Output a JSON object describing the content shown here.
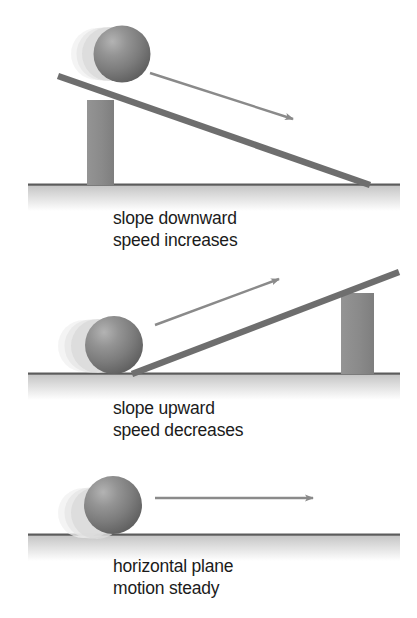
{
  "figure": {
    "background_color": "#ffffff",
    "width": 417,
    "height": 618,
    "colors": {
      "ball": "#7d7d7d",
      "ball_highlight": "#a8a8a8",
      "ball_shadow": "#5a5a5a",
      "ball_ghost": "#d9d9d9",
      "ramp_bar": "#6e6e6e",
      "support_block": "#8c8c8c",
      "ground_band": "#d4d4d4",
      "ground_edge": "#5c5c5c",
      "arrow": "#8a8a8a",
      "caption": "#1b1b1b"
    }
  },
  "panels": [
    {
      "id": "panel-slope-downward",
      "caption_line1": "slope downward",
      "caption_line2": "speed increases",
      "ramp": "downward",
      "arrow_direction": "down-right",
      "support_side": "left",
      "ball_position": "top-of-ramp"
    },
    {
      "id": "panel-slope-upward",
      "caption_line1": "slope upward",
      "caption_line2": "speed decreases",
      "ramp": "upward",
      "arrow_direction": "up-right",
      "support_side": "right",
      "ball_position": "bottom-of-ramp"
    },
    {
      "id": "panel-horizontal-plane",
      "caption_line1": "horizontal plane",
      "caption_line2": "motion steady",
      "ramp": "none",
      "arrow_direction": "right",
      "support_side": "none",
      "ball_position": "on-ground"
    }
  ]
}
